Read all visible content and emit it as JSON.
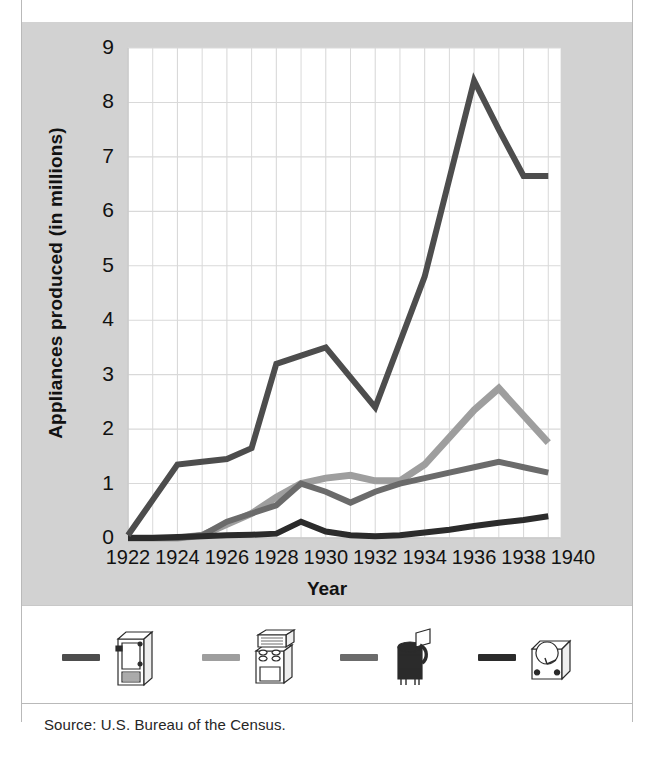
{
  "figure": {
    "title_cut": "",
    "source": "Source: U.S. Bureau of the Census.",
    "background": "#d2d2d2",
    "panel": "#ffffff"
  },
  "chart_data": {
    "type": "line",
    "title": "",
    "xlabel": "Year",
    "ylabel": "Appliances produced (in millions)",
    "xlim": [
      1922,
      1940
    ],
    "ylim": [
      0,
      9
    ],
    "xticks": [
      1922,
      1924,
      1926,
      1928,
      1930,
      1932,
      1934,
      1936,
      1938,
      1940
    ],
    "yticks": [
      0,
      1,
      2,
      3,
      4,
      5,
      6,
      7,
      8,
      9
    ],
    "grid": true,
    "minor_grid_x_step": 1,
    "legend_position": "below-plot",
    "x": [
      1922,
      1923,
      1924,
      1925,
      1926,
      1927,
      1928,
      1929,
      1930,
      1931,
      1932,
      1933,
      1934,
      1935,
      1936,
      1937,
      1938,
      1939
    ],
    "series": [
      {
        "name": "refrigerators",
        "icon": "refrigerator-icon",
        "color": "#4d4d4d",
        "width": 6,
        "values": [
          0.05,
          0.7,
          1.35,
          1.4,
          1.45,
          1.65,
          3.2,
          3.35,
          3.5,
          2.95,
          2.4,
          3.6,
          4.8,
          6.6,
          8.4,
          7.5,
          6.65,
          6.65
        ]
      },
      {
        "name": "ranges-stoves",
        "icon": "stove-icon",
        "color": "#9e9e9e",
        "width": 7,
        "values": [
          0,
          0,
          0,
          0.05,
          0.25,
          0.45,
          0.75,
          1.0,
          1.1,
          1.15,
          1.05,
          1.05,
          1.35,
          1.85,
          2.35,
          2.75,
          2.25,
          1.75
        ]
      },
      {
        "name": "washing-machines",
        "icon": "washing-machine-icon",
        "color": "#6b6b6b",
        "width": 6,
        "values": [
          0,
          0,
          0,
          0.05,
          0.3,
          0.45,
          0.6,
          1.0,
          0.85,
          0.65,
          0.85,
          1.0,
          1.1,
          1.2,
          1.3,
          1.4,
          1.3,
          1.2
        ]
      },
      {
        "name": "vacuum-cleaners",
        "icon": "vacuum-icon",
        "color": "#2b2b2b",
        "width": 6,
        "values": [
          0,
          0,
          0.02,
          0.03,
          0.05,
          0.06,
          0.08,
          0.3,
          0.12,
          0.05,
          0.03,
          0.05,
          0.1,
          0.15,
          0.22,
          0.28,
          0.33,
          0.4
        ]
      }
    ]
  },
  "legend": [
    {
      "icon": "refrigerator-icon",
      "color": "#4d4d4d"
    },
    {
      "icon": "stove-icon",
      "color": "#9e9e9e"
    },
    {
      "icon": "washing-machine-icon",
      "color": "#6b6b6b"
    },
    {
      "icon": "vacuum-icon",
      "color": "#2b2b2b"
    }
  ]
}
